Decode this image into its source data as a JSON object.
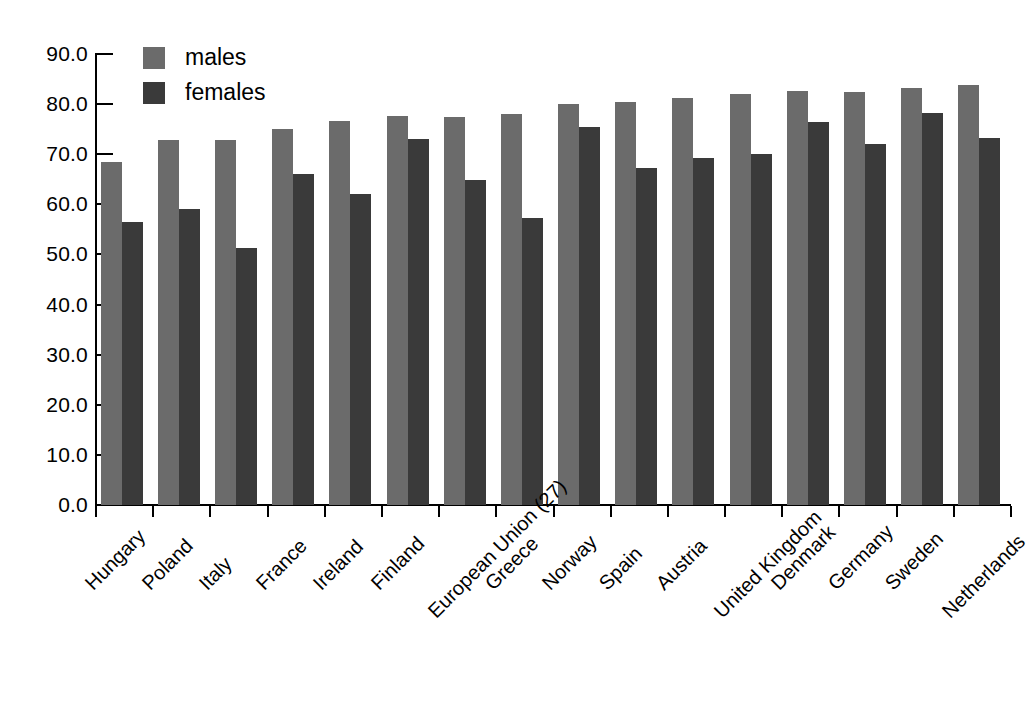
{
  "chart_data": {
    "type": "bar",
    "title": "",
    "xlabel": "",
    "ylabel": "",
    "ylim": [
      0,
      90
    ],
    "ytick_labels": [
      "90.0",
      "80.0",
      "70.0",
      "60.0",
      "50.0",
      "40.0",
      "30.0",
      "20.0",
      "10.0",
      "0.0"
    ],
    "ytick_values": [
      90,
      80,
      70,
      60,
      50,
      40,
      30,
      20,
      10,
      0
    ],
    "grid": false,
    "legend_position": "top-left",
    "categories": [
      "Hungary",
      "Poland",
      "Italy",
      "France",
      "Ireland",
      "Finland",
      "European Union (27)",
      "Greece",
      "Norway",
      "Spain",
      "Austria",
      "United Kingdom",
      "Denmark",
      "Germany",
      "Sweden",
      "Netherlands"
    ],
    "series": [
      {
        "name": "males",
        "color": "#6b6b6b",
        "values": [
          68.4,
          72.8,
          72.8,
          75.0,
          76.6,
          77.6,
          77.4,
          78.0,
          80.0,
          80.5,
          81.3,
          82.0,
          82.6,
          82.5,
          83.2,
          83.9
        ]
      },
      {
        "name": "females",
        "color": "#3a3a3a",
        "values": [
          56.4,
          59.0,
          51.3,
          66.0,
          62.0,
          73.0,
          64.8,
          57.3,
          75.5,
          67.3,
          69.3,
          70.1,
          76.4,
          72.1,
          78.3,
          73.2
        ]
      }
    ]
  },
  "legend": {
    "items": [
      {
        "label": "males",
        "swatch_class": "males"
      },
      {
        "label": "females",
        "swatch_class": "females"
      }
    ]
  }
}
